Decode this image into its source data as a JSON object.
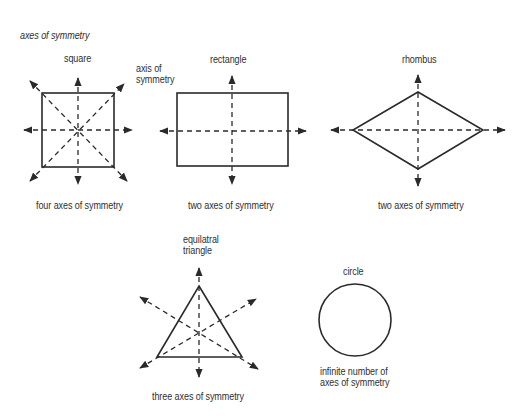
{
  "title": "axes of symmetry",
  "annotation": {
    "line1": "axis of",
    "line2": "symmetry"
  },
  "shapes": [
    {
      "name": "square",
      "label": "square",
      "caption": "four axes of symmetry",
      "axes": 4
    },
    {
      "name": "rectangle",
      "label": "rectangle",
      "caption": "two axes of symmetry",
      "axes": 2
    },
    {
      "name": "rhombus",
      "label": "rhombus",
      "caption": "two axes of symmetry",
      "axes": 2
    },
    {
      "name": "equilateral-triangle",
      "label_line1": "equilatral",
      "label_line2": "triangle",
      "caption": "three axes of symmetry",
      "axes": 3
    },
    {
      "name": "circle",
      "label": "circle",
      "caption_line1": "infinite number of",
      "caption_line2": "axes of symmetry",
      "axes": "infinite"
    }
  ],
  "colors": {
    "stroke": "#2a2a2a",
    "background": "#ffffff"
  }
}
